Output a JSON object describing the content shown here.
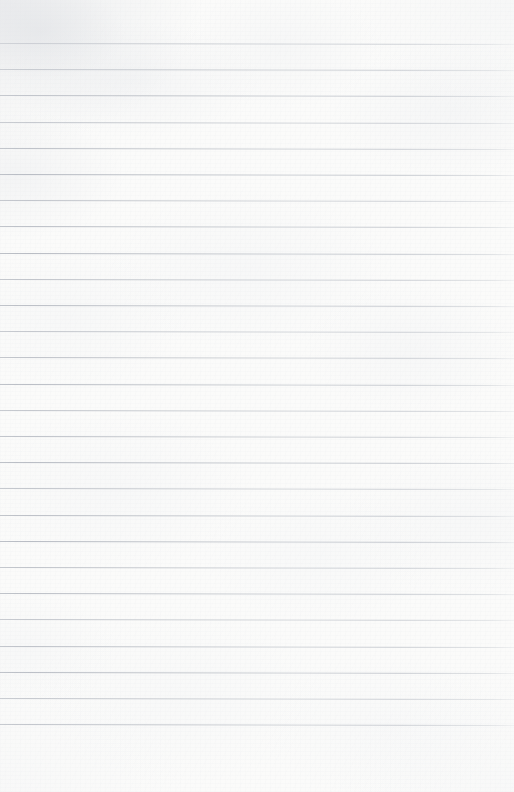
{
  "document": {
    "kind": "lined-notebook-page",
    "title": "Blank ruled notebook page",
    "page_width": 514,
    "page_height": 792,
    "body_text": "",
    "handwriting": "",
    "printed_text": "",
    "page_number": "",
    "header_text": "",
    "footer_text": ""
  },
  "paper": {
    "background_color": "#fbfbfa",
    "texture": "mottled fibrous scan texture",
    "has_margin_line": false,
    "has_holes": false,
    "has_header_fields": false
  },
  "rules": {
    "color": "#b9bdc4",
    "thickness_px": 1,
    "count": 27,
    "first_line_y": 43,
    "spacing_px": 26.2,
    "last_line_y": 741,
    "slope_deg": 0.11,
    "full_bleed": true,
    "left_edge_x": 0,
    "right_edge_x": 514,
    "bottom_margin_px": 51
  }
}
